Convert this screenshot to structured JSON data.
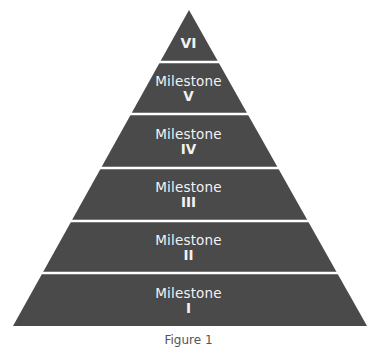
{
  "diagram": {
    "type": "pyramid",
    "fill_color": "#4a4a4a",
    "separator_color": "#ffffff",
    "text_color": "#f2f2f2",
    "levels": [
      {
        "name": "",
        "numeral": "VI"
      },
      {
        "name": "Milestone",
        "numeral": "V"
      },
      {
        "name": "Milestone",
        "numeral": "IV"
      },
      {
        "name": "Milestone",
        "numeral": "III"
      },
      {
        "name": "Milestone",
        "numeral": "II"
      },
      {
        "name": "Milestone",
        "numeral": "I"
      }
    ]
  },
  "caption": "Figure 1"
}
